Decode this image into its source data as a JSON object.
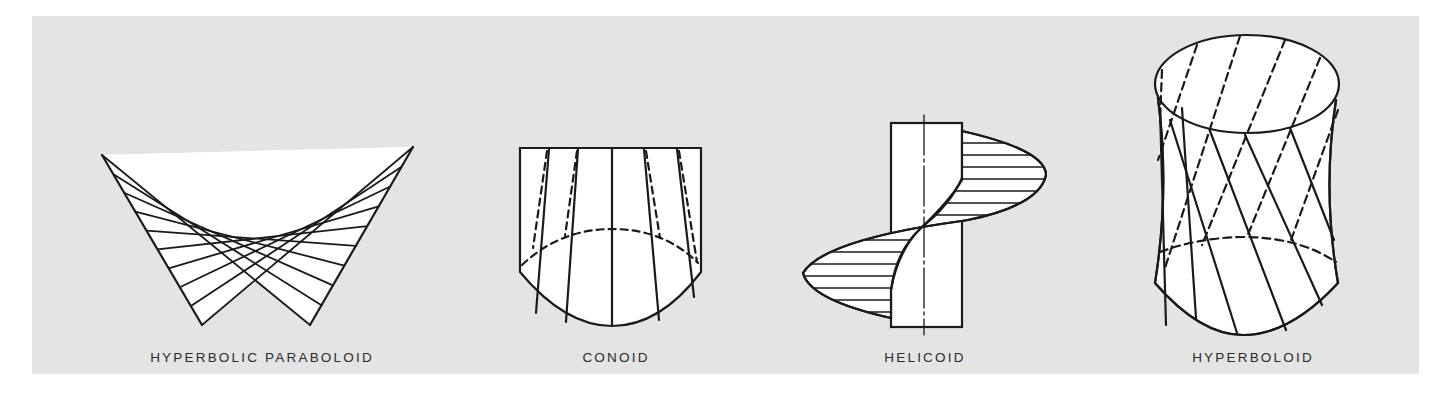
{
  "figure": {
    "background_color": "#e4e4e4",
    "line_color": "#1a1a1a",
    "fill_color": "#ffffff",
    "surfaces": [
      {
        "id": "hyperbolic-paraboloid",
        "label": "HYPERBOLIC PARABOLOID"
      },
      {
        "id": "conoid",
        "label": "CONOID"
      },
      {
        "id": "helicoid",
        "label": "HELICOID"
      },
      {
        "id": "hyperboloid",
        "label": "HYPERBOLOID"
      }
    ]
  }
}
